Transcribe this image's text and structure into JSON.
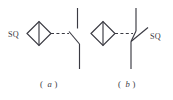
{
  "figure": {
    "background_color": "#ffffff",
    "line_color": "#3a3a42",
    "title": "",
    "panels": [
      {
        "id": "a",
        "caption_open": "(",
        "caption_letter": "a",
        "caption_close": ")",
        "label": "SQ",
        "label_position": "left",
        "symbol_name": "position-limit-switch-normally-closed",
        "actuator_symbol": "diamond-with-vertical-bar",
        "linkage_style": "dashed",
        "contact_type": "break-contact"
      },
      {
        "id": "b",
        "caption_open": "(",
        "caption_letter": "b",
        "caption_close": ")",
        "label": "SQ",
        "label_position": "right",
        "symbol_name": "position-limit-switch-normally-open",
        "actuator_symbol": "diamond-with-vertical-bar",
        "linkage_style": "dashed",
        "contact_type": "make-contact"
      }
    ]
  }
}
